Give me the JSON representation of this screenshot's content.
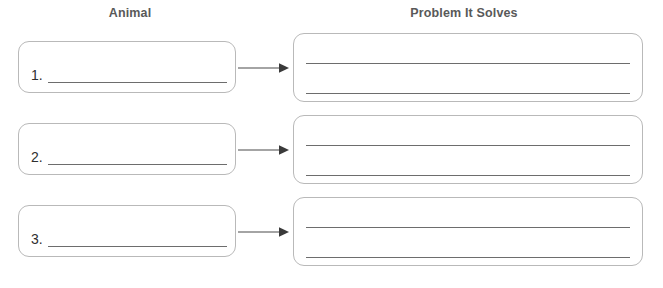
{
  "worksheet": {
    "columns": {
      "left_heading": "Animal",
      "right_heading": "Problem It Solves"
    },
    "rows": [
      {
        "number": "1.",
        "animal_answer": "",
        "problem_answer_line_1": "",
        "problem_answer_line_2": "",
        "connector": "arrow-right"
      },
      {
        "number": "2.",
        "animal_answer": "",
        "problem_answer_line_1": "",
        "problem_answer_line_2": "",
        "connector": "arrow-right"
      },
      {
        "number": "3.",
        "animal_answer": "",
        "problem_answer_line_1": "",
        "problem_answer_line_2": "",
        "connector": "arrow-right"
      }
    ],
    "colors": {
      "background": "#ffffff",
      "heading_text": "#595959",
      "number_text": "#2f2f2f",
      "box_border": "#b9b9b9",
      "rule_line": "#6d6d6d",
      "arrow": "#4a4a4a"
    }
  }
}
